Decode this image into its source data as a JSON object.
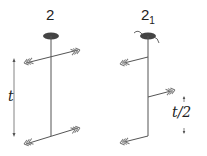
{
  "diagram": {
    "left": {
      "symbol": "2",
      "name": "two-fold rotation axis",
      "translation_label": "t"
    },
    "right": {
      "symbol": "2",
      "subscript": "1",
      "name": "two-fold screw axis",
      "translation_label": "t/2"
    },
    "colors": {
      "line": "#555555",
      "axis_marker": "#444444",
      "text": "#222222"
    }
  }
}
